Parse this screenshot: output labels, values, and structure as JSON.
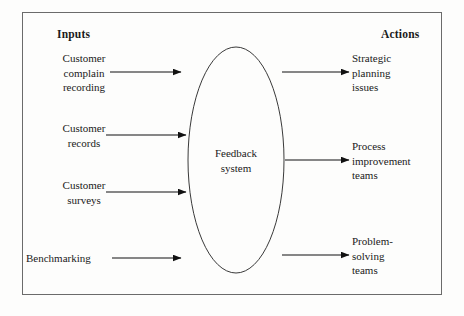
{
  "diagram": {
    "type": "flow-diagram",
    "border_color": "#6b6b6b",
    "line_color": "#1a1a1a",
    "background": "#fdfdfc",
    "columns": {
      "left_heading": "Inputs",
      "right_heading": "Actions"
    },
    "center_node": {
      "shape": "ellipse",
      "label": "Feedback\nsystem",
      "cx": 236,
      "cy": 160,
      "rx": 48,
      "ry": 113
    },
    "inputs": [
      {
        "label": "Customer\ncomplain\nrecording",
        "arrow_y": 72,
        "arrow_x1": 110,
        "arrow_x2": 181
      },
      {
        "label": "Customer\nrecords",
        "arrow_y": 135,
        "arrow_x1": 106,
        "arrow_x2": 186
      },
      {
        "label": "Customer\nsurveys",
        "arrow_y": 192,
        "arrow_x1": 106,
        "arrow_x2": 186
      },
      {
        "label": "Benchmarking",
        "arrow_y": 258,
        "arrow_x1": 112,
        "arrow_x2": 181
      }
    ],
    "outputs": [
      {
        "label": "Strategic\nplanning\nissues",
        "arrow_y": 72,
        "arrow_x1": 282,
        "arrow_x2": 349
      },
      {
        "label": "Process\nimprovement\nteams",
        "arrow_y": 160,
        "arrow_x1": 285,
        "arrow_x2": 349
      },
      {
        "label": "Problem-\nsolving\nteams",
        "arrow_y": 255,
        "arrow_x1": 282,
        "arrow_x2": 349
      }
    ]
  }
}
